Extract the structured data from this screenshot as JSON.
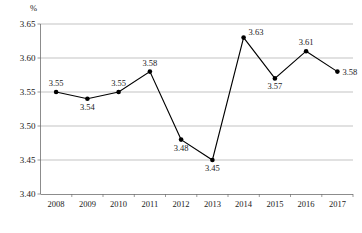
{
  "chart_data": {
    "type": "line",
    "title": "",
    "xlabel": "",
    "ylabel": "%",
    "ylim": [
      3.4,
      3.65
    ],
    "ytick_labels": [
      "3.65",
      "3.60",
      "3.55",
      "3.50",
      "3.45",
      "3.40"
    ],
    "ytick_values": [
      3.65,
      3.6,
      3.55,
      3.5,
      3.45,
      3.4
    ],
    "grid": true,
    "legend": "none",
    "categories": [
      "2008",
      "2009",
      "2010",
      "2011",
      "2012",
      "2013",
      "2014",
      "2015",
      "2016",
      "2017"
    ],
    "values": [
      3.55,
      3.54,
      3.55,
      3.58,
      3.48,
      3.45,
      3.63,
      3.57,
      3.61,
      3.58
    ],
    "point_labels": [
      "3.55",
      "3.54",
      "3.55",
      "3.58",
      "3.48",
      "3.45",
      "3.63",
      "3.57",
      "3.61",
      "3.58"
    ],
    "label_positions": [
      "above",
      "below",
      "above",
      "above",
      "below",
      "below",
      "above-right",
      "below",
      "above",
      "right"
    ],
    "series": [
      {
        "name": "",
        "values": [
          3.55,
          3.54,
          3.55,
          3.58,
          3.48,
          3.45,
          3.63,
          3.57,
          3.61,
          3.58
        ],
        "color": "#000000",
        "marker": "circle"
      }
    ]
  },
  "colors": {
    "line": "#000000",
    "marker": "#000000",
    "gridline": "#9a9a9a",
    "axis": "#6e6e6e",
    "text": "#1a1a1a",
    "background": "#ffffff"
  },
  "caption": {
    "text": ""
  }
}
